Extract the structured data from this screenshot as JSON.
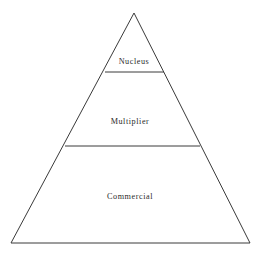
{
  "diagram": {
    "type": "pyramid",
    "title": "",
    "background_color": "#ffffff",
    "stroke_color": "#3a3a3a",
    "text_color": "#2b2b2b",
    "apex": {
      "x": 134,
      "y": 13
    },
    "base_left": {
      "x": 11,
      "y": 243
    },
    "base_right": {
      "x": 250,
      "y": 243
    },
    "tiers": [
      {
        "id": "nucleus",
        "label": "Nucleus",
        "level": 1,
        "position": "top",
        "label_x": 134,
        "label_y": 64,
        "divider": {
          "y": 72,
          "x1": 105,
          "x2": 164
        }
      },
      {
        "id": "multiplier",
        "label": "Multiplier",
        "level": 2,
        "position": "middle",
        "label_x": 130,
        "label_y": 124,
        "divider": {
          "y": 146,
          "x1": 65,
          "x2": 200
        }
      },
      {
        "id": "commercial",
        "label": "Commercial",
        "level": 3,
        "position": "bottom",
        "label_x": 130,
        "label_y": 199,
        "divider": null
      }
    ]
  }
}
